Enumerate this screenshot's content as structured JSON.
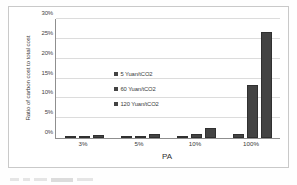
{
  "chart_data": {
    "type": "bar",
    "title": "",
    "xlabel": "PA",
    "ylabel": "Ratio of carbon cost to total cost",
    "categories": [
      "3%",
      "5%",
      "10%",
      "100%"
    ],
    "series": [
      {
        "name": "5 Yuan/tCO2",
        "values": [
          0.05,
          0.1,
          0.15,
          0.9
        ]
      },
      {
        "name": "60 Yuan/tCO2",
        "values": [
          0.35,
          0.55,
          1.1,
          13.3
        ]
      },
      {
        "name": "120 Yuan/tCO2",
        "values": [
          0.7,
          1.1,
          2.6,
          26.8
        ]
      }
    ],
    "ylim": [
      0,
      30
    ],
    "yticks": [
      "0%",
      "5%",
      "10%",
      "15%",
      "20%",
      "25%",
      "30%"
    ],
    "ytick_values": [
      0,
      5,
      10,
      15,
      20,
      25,
      30
    ],
    "grid": true,
    "legend_position": "inside-center-left",
    "bar_color": "#434343",
    "gridline_color": "#dcdcdc",
    "axis_color": "#8f8f8f"
  }
}
